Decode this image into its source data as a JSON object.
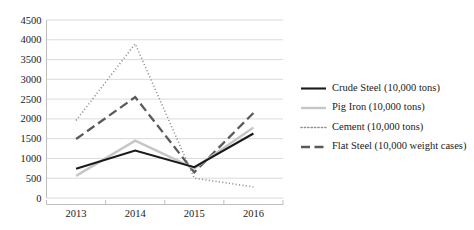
{
  "chart_data": {
    "type": "line",
    "title": "",
    "subtitle": "",
    "xlabel": "",
    "ylabel": "",
    "categories": [
      "2013",
      "2014",
      "2015",
      "2016"
    ],
    "ylim": [
      0,
      4500
    ],
    "yticks": [
      "0",
      "500",
      "1000",
      "1500",
      "2000",
      "2500",
      "3000",
      "3500",
      "4000",
      "4500"
    ],
    "ytick_values": [
      0,
      500,
      1000,
      1500,
      2000,
      2500,
      3000,
      3500,
      4000,
      4500
    ],
    "grid": true,
    "legend_position": "right",
    "series": [
      {
        "name": "Crude Steel (10,000 tons)",
        "values": [
          740,
          1200,
          780,
          1630
        ],
        "color": "#1a1a1a",
        "style": "solid",
        "width": 2.1
      },
      {
        "name": "Pig Iron (10,000 tons)",
        "values": [
          560,
          1450,
          750,
          1780
        ],
        "color": "#c6c6c6",
        "style": "solid",
        "width": 2.4
      },
      {
        "name": "Cement (10,000 tons)",
        "values": [
          1960,
          3900,
          500,
          280
        ],
        "color": "#8f8f8f",
        "style": "dotted",
        "width": 1.6
      },
      {
        "name": "Flat Steel (10,000 weight cases)",
        "values": [
          1490,
          2550,
          650,
          2150
        ],
        "color": "#5a5a5a",
        "style": "dashed",
        "width": 2.3
      }
    ]
  },
  "legend": {
    "items": [
      {
        "label": "Crude Steel (10,000 tons)",
        "swatch": "solid-line-swatch-dark"
      },
      {
        "label": "Pig Iron (10,000 tons)",
        "swatch": "solid-line-swatch-light"
      },
      {
        "label": "Cement (10,000 tons)",
        "swatch": "dotted-line-swatch"
      },
      {
        "label": "Flat Steel (10,000 weight cases)",
        "swatch": "dashed-line-swatch"
      }
    ]
  }
}
